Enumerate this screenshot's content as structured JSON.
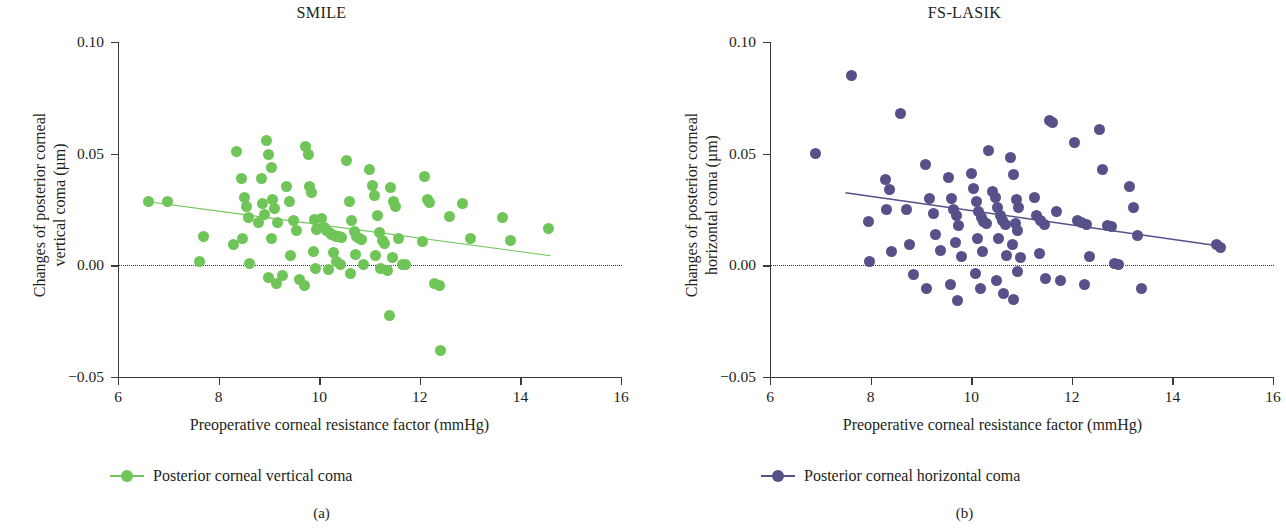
{
  "figure": {
    "subfig_a": "(a)",
    "subfig_b": "(b)"
  },
  "panel_a": {
    "title": "SMILE",
    "ylabel_line1": "Changes of posterior corneal",
    "ylabel_line2": "vertical coma (µm)",
    "xlabel": "Preoperative corneal resistance factor (mmHg)",
    "legend_label": "Posterior corneal vertical coma",
    "color": "#6FC557"
  },
  "panel_b": {
    "title": "FS-LASIK",
    "ylabel_line1": "Changes of posterior corneal",
    "ylabel_line2": "horizontal coma (µm)",
    "xlabel": "Preoperative corneal resistance factor (mmHg)",
    "legend_label": "Posterior corneal horizontal coma",
    "color": "#565188"
  },
  "chart_data": [
    {
      "type": "scatter",
      "panel": "a",
      "title": "SMILE",
      "xlabel": "Preoperative corneal resistance factor (mmHg)",
      "ylabel": "Changes of posterior corneal vertical coma (µm)",
      "xlim": [
        6,
        16
      ],
      "ylim": [
        -0.05,
        0.1
      ],
      "xticks": [
        6,
        8,
        10,
        12,
        14,
        16
      ],
      "yticks": [
        -0.05,
        0.0,
        0.05,
        0.1
      ],
      "xtick_labels": [
        "6",
        "8",
        "10",
        "12",
        "14",
        "16"
      ],
      "ytick_labels": [
        "−0.05",
        "0.00",
        "0.05",
        "0.10"
      ],
      "grid": false,
      "zero_reference_line": 0.0,
      "marker_color": "#6FC557",
      "legend": [
        "Posterior corneal vertical coma"
      ],
      "legend_position": "below-axes-left",
      "trendline": {
        "x": [
          6.6,
          14.6
        ],
        "y": [
          0.0285,
          0.0043
        ],
        "slope": -0.003,
        "intercept": 0.0485
      },
      "points": [
        [
          6.6,
          0.0285
        ],
        [
          6.98,
          0.0285
        ],
        [
          7.7,
          0.013
        ],
        [
          7.62,
          0.0017
        ],
        [
          8.35,
          0.051
        ],
        [
          8.45,
          0.039
        ],
        [
          8.52,
          0.0305
        ],
        [
          8.55,
          0.0265
        ],
        [
          8.6,
          0.0215
        ],
        [
          8.48,
          0.0118
        ],
        [
          8.3,
          0.0092
        ],
        [
          8.62,
          0.001
        ],
        [
          8.85,
          0.039
        ],
        [
          8.88,
          0.0275
        ],
        [
          8.92,
          0.0228
        ],
        [
          8.8,
          0.0192
        ],
        [
          8.95,
          0.056
        ],
        [
          9.0,
          0.0495
        ],
        [
          9.05,
          0.044
        ],
        [
          9.08,
          0.0295
        ],
        [
          9.12,
          0.0255
        ],
        [
          9.18,
          0.0192
        ],
        [
          9.05,
          0.012
        ],
        [
          9.0,
          -0.0055
        ],
        [
          9.15,
          -0.008
        ],
        [
          9.28,
          -0.0045
        ],
        [
          9.35,
          0.0355
        ],
        [
          9.4,
          0.0285
        ],
        [
          9.48,
          0.02
        ],
        [
          9.55,
          0.0155
        ],
        [
          9.42,
          0.0045
        ],
        [
          9.6,
          -0.0065
        ],
        [
          9.72,
          0.053
        ],
        [
          9.78,
          0.0495
        ],
        [
          9.8,
          0.0355
        ],
        [
          9.85,
          0.0325
        ],
        [
          9.9,
          0.0205
        ],
        [
          9.95,
          0.0162
        ],
        [
          9.88,
          0.006
        ],
        [
          9.92,
          -0.0012
        ],
        [
          9.7,
          -0.009
        ],
        [
          10.05,
          0.021
        ],
        [
          10.1,
          0.0168
        ],
        [
          10.15,
          0.0155
        ],
        [
          10.2,
          0.0148
        ],
        [
          10.25,
          0.014
        ],
        [
          10.3,
          0.0135
        ],
        [
          10.35,
          0.013
        ],
        [
          10.4,
          0.0128
        ],
        [
          10.45,
          0.0125
        ],
        [
          10.28,
          0.0058
        ],
        [
          10.35,
          0.0018
        ],
        [
          10.42,
          0.0005
        ],
        [
          10.18,
          -0.0018
        ],
        [
          10.55,
          0.0468
        ],
        [
          10.6,
          0.0288
        ],
        [
          10.65,
          0.02
        ],
        [
          10.7,
          0.0152
        ],
        [
          10.75,
          0.0128
        ],
        [
          10.8,
          0.012
        ],
        [
          10.85,
          0.0115
        ],
        [
          10.72,
          0.005
        ],
        [
          10.88,
          0.0002
        ],
        [
          10.62,
          -0.0035
        ],
        [
          11.0,
          0.0428
        ],
        [
          11.05,
          0.0358
        ],
        [
          11.1,
          0.0312
        ],
        [
          11.15,
          0.0222
        ],
        [
          11.2,
          0.0148
        ],
        [
          11.25,
          0.0112
        ],
        [
          11.3,
          0.0098
        ],
        [
          11.12,
          0.0042
        ],
        [
          11.22,
          -0.0012
        ],
        [
          11.35,
          -0.0022
        ],
        [
          11.42,
          0.035
        ],
        [
          11.48,
          0.0285
        ],
        [
          11.52,
          0.0262
        ],
        [
          11.58,
          0.0118
        ],
        [
          11.45,
          0.0035
        ],
        [
          11.4,
          -0.0225
        ],
        [
          11.65,
          0.0005
        ],
        [
          11.72,
          0.0002
        ],
        [
          12.1,
          0.04
        ],
        [
          12.15,
          0.0295
        ],
        [
          12.2,
          0.0282
        ],
        [
          12.05,
          0.0105
        ],
        [
          12.3,
          -0.008
        ],
        [
          12.4,
          -0.009
        ],
        [
          12.42,
          -0.0382
        ],
        [
          12.6,
          0.0218
        ],
        [
          12.85,
          0.0275
        ],
        [
          13.0,
          0.0118
        ],
        [
          13.65,
          0.0215
        ],
        [
          13.8,
          0.011
        ],
        [
          14.55,
          0.0165
        ]
      ]
    },
    {
      "type": "scatter",
      "panel": "b",
      "title": "FS-LASIK",
      "xlabel": "Preoperative corneal resistance factor (mmHg)",
      "ylabel": "Changes of posterior corneal horizontal coma (µm)",
      "xlim": [
        6,
        16
      ],
      "ylim": [
        -0.05,
        0.1
      ],
      "xticks": [
        6,
        8,
        10,
        12,
        14,
        16
      ],
      "yticks": [
        -0.05,
        0.0,
        0.05,
        0.1
      ],
      "xtick_labels": [
        "6",
        "8",
        "10",
        "12",
        "14",
        "16"
      ],
      "ytick_labels": [
        "−0.05",
        "0.00",
        "0.05",
        "0.10"
      ],
      "grid": false,
      "zero_reference_line": 0.0,
      "marker_color": "#565188",
      "legend": [
        "Posterior corneal horizontal coma"
      ],
      "legend_position": "below-axes-left",
      "trendline": {
        "x": [
          7.5,
          14.9
        ],
        "y": [
          0.0325,
          0.0088
        ],
        "slope": -0.0032,
        "intercept": 0.0565
      },
      "points": [
        [
          6.9,
          0.05
        ],
        [
          7.62,
          0.085
        ],
        [
          7.95,
          0.0198
        ],
        [
          7.98,
          0.0018
        ],
        [
          8.3,
          0.0385
        ],
        [
          8.38,
          0.034
        ],
        [
          8.32,
          0.025
        ],
        [
          8.42,
          0.006
        ],
        [
          8.6,
          0.068
        ],
        [
          8.72,
          0.0252
        ],
        [
          8.78,
          0.0095
        ],
        [
          8.85,
          -0.004
        ],
        [
          9.1,
          0.0452
        ],
        [
          9.18,
          0.03
        ],
        [
          9.25,
          0.0232
        ],
        [
          9.3,
          0.014
        ],
        [
          9.38,
          0.0068
        ],
        [
          9.12,
          -0.0102
        ],
        [
          9.55,
          0.0395
        ],
        [
          9.6,
          0.03
        ],
        [
          9.65,
          0.0252
        ],
        [
          9.7,
          0.0222
        ],
        [
          9.75,
          0.018
        ],
        [
          9.68,
          0.0102
        ],
        [
          9.8,
          0.004
        ],
        [
          9.58,
          -0.0085
        ],
        [
          9.72,
          -0.0158
        ],
        [
          10.0,
          0.0412
        ],
        [
          10.05,
          0.0345
        ],
        [
          10.1,
          0.0288
        ],
        [
          10.15,
          0.0242
        ],
        [
          10.2,
          0.0215
        ],
        [
          10.25,
          0.0198
        ],
        [
          10.3,
          0.0188
        ],
        [
          10.12,
          0.0118
        ],
        [
          10.22,
          0.0062
        ],
        [
          10.08,
          -0.0038
        ],
        [
          10.18,
          -0.0102
        ],
        [
          10.35,
          0.0512
        ],
        [
          10.42,
          0.033
        ],
        [
          10.48,
          0.0302
        ],
        [
          10.52,
          0.0258
        ],
        [
          10.58,
          0.0222
        ],
        [
          10.62,
          0.02
        ],
        [
          10.68,
          0.0185
        ],
        [
          10.55,
          0.012
        ],
        [
          10.7,
          0.0045
        ],
        [
          10.5,
          -0.0068
        ],
        [
          10.65,
          -0.0125
        ],
        [
          10.78,
          0.0482
        ],
        [
          10.85,
          0.0405
        ],
        [
          10.9,
          0.0295
        ],
        [
          10.95,
          0.0258
        ],
        [
          10.88,
          0.0188
        ],
        [
          10.92,
          0.0158
        ],
        [
          10.82,
          0.0092
        ],
        [
          10.98,
          0.0035
        ],
        [
          10.92,
          -0.0028
        ],
        [
          10.85,
          -0.0155
        ],
        [
          11.25,
          0.0305
        ],
        [
          11.3,
          0.0222
        ],
        [
          11.38,
          0.02
        ],
        [
          11.45,
          0.0182
        ],
        [
          11.35,
          0.0052
        ],
        [
          11.48,
          -0.0058
        ],
        [
          11.55,
          0.065
        ],
        [
          11.62,
          0.0638
        ],
        [
          11.7,
          0.0242
        ],
        [
          11.78,
          -0.0068
        ],
        [
          12.05,
          0.055
        ],
        [
          12.12,
          0.0202
        ],
        [
          12.2,
          0.0192
        ],
        [
          12.3,
          0.0182
        ],
        [
          12.35,
          0.004
        ],
        [
          12.25,
          -0.0085
        ],
        [
          12.55,
          0.061
        ],
        [
          12.62,
          0.043
        ],
        [
          12.7,
          0.018
        ],
        [
          12.78,
          0.0172
        ],
        [
          12.85,
          0.0008
        ],
        [
          12.92,
          0.0002
        ],
        [
          13.15,
          0.0352
        ],
        [
          13.22,
          0.0258
        ],
        [
          13.3,
          0.0135
        ],
        [
          13.38,
          -0.0105
        ],
        [
          14.88,
          0.0092
        ],
        [
          14.95,
          0.0082
        ]
      ]
    }
  ]
}
